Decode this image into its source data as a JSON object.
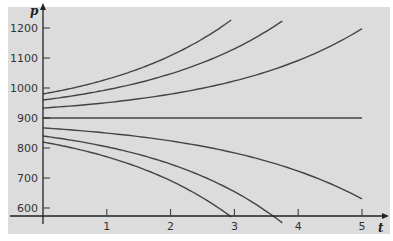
{
  "chart_data": {
    "type": "line",
    "title": "",
    "xlabel": "t",
    "ylabel": "p",
    "xlim": [
      0,
      5.2
    ],
    "ylim": [
      575,
      1250
    ],
    "x_ticks": [
      1,
      2,
      3,
      4,
      5
    ],
    "y_ticks": [
      600,
      700,
      800,
      900,
      1000,
      1100,
      1200
    ],
    "grid": false,
    "legend": null,
    "background_color": "#dcdcdc",
    "line_color": "#444444",
    "equilibrium": 900,
    "series": [
      {
        "name": "p0=980",
        "p0": 980,
        "k": 0.477,
        "t_end": 2.95,
        "x": [
          0,
          1,
          2,
          2.95
        ],
        "values": [
          980,
          1020,
          1093,
          1227
        ]
      },
      {
        "name": "p0=960",
        "p0": 960,
        "k": 0.449,
        "t_end": 3.75,
        "x": [
          0,
          1,
          2,
          3,
          3.75
        ],
        "values": [
          960,
          985,
          1034,
          1131,
          1223
        ]
      },
      {
        "name": "p0=933",
        "p0": 933,
        "k": 0.44,
        "t_end": 5.0,
        "x": [
          0,
          1,
          2,
          3,
          4,
          5
        ],
        "values": [
          933,
          944,
          961,
          995,
          1050,
          1197
        ]
      },
      {
        "name": "p0=900",
        "p0": 900,
        "k": 0.44,
        "t_end": 5.0,
        "x": [
          0,
          5
        ],
        "values": [
          900,
          900
        ]
      },
      {
        "name": "p0=867",
        "p0": 867,
        "k": 0.42,
        "t_end": 5.0,
        "x": [
          0,
          1,
          2,
          3,
          4,
          5
        ],
        "values": [
          867,
          850,
          824,
          782,
          720,
          595
        ]
      },
      {
        "name": "p0=840",
        "p0": 840,
        "k": 0.47,
        "t_end": 3.75,
        "x": [
          0,
          1,
          2,
          3,
          3.75
        ],
        "values": [
          840,
          816,
          768,
          668,
          577
        ]
      },
      {
        "name": "p0=820",
        "p0": 820,
        "k": 0.48,
        "t_end": 2.95,
        "x": [
          0,
          1,
          2,
          2.95
        ],
        "values": [
          820,
          771,
          707,
          574
        ]
      }
    ]
  }
}
